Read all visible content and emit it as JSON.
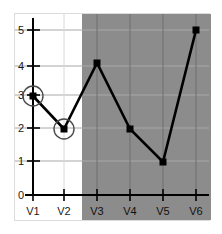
{
  "chart_data": {
    "type": "line",
    "title": "",
    "xlabel": "",
    "ylabel": "",
    "categories": [
      "V1",
      "V2",
      "V3",
      "V4",
      "V5",
      "V6"
    ],
    "values": [
      3,
      2,
      4,
      2,
      1,
      5
    ],
    "series": [
      {
        "name": "series-1",
        "values": [
          3,
          2,
          4,
          2,
          1,
          5
        ]
      }
    ],
    "ylim": [
      0,
      5
    ],
    "yticks": [
      0,
      1,
      2,
      3,
      4,
      5
    ],
    "ytick_labels": [
      "0",
      "1",
      "2",
      "3",
      "4",
      "5"
    ],
    "xtick_labels": [
      "V1",
      "V2",
      "V3",
      "V4",
      "V5",
      "V6"
    ],
    "grid": true,
    "legend": "none",
    "marker": "square",
    "line_color": "#000000",
    "marker_color": "#000000",
    "annotations": [
      {
        "kind": "circle-highlight",
        "category": "V1",
        "value": 3
      },
      {
        "kind": "circle-highlight",
        "category": "V2",
        "value": 2
      }
    ],
    "shaded_region": {
      "kind": "vertical-band",
      "from_category": "V2",
      "to_category": "V6",
      "color": "#8c8c8c",
      "label": ""
    },
    "colors": {
      "background": "#ffffff",
      "shading": "#8c8c8c",
      "grid": "#9b9b9b",
      "axis": "#000000",
      "annotation": "#3a3a3a",
      "frame": "#dcdcdc"
    }
  }
}
